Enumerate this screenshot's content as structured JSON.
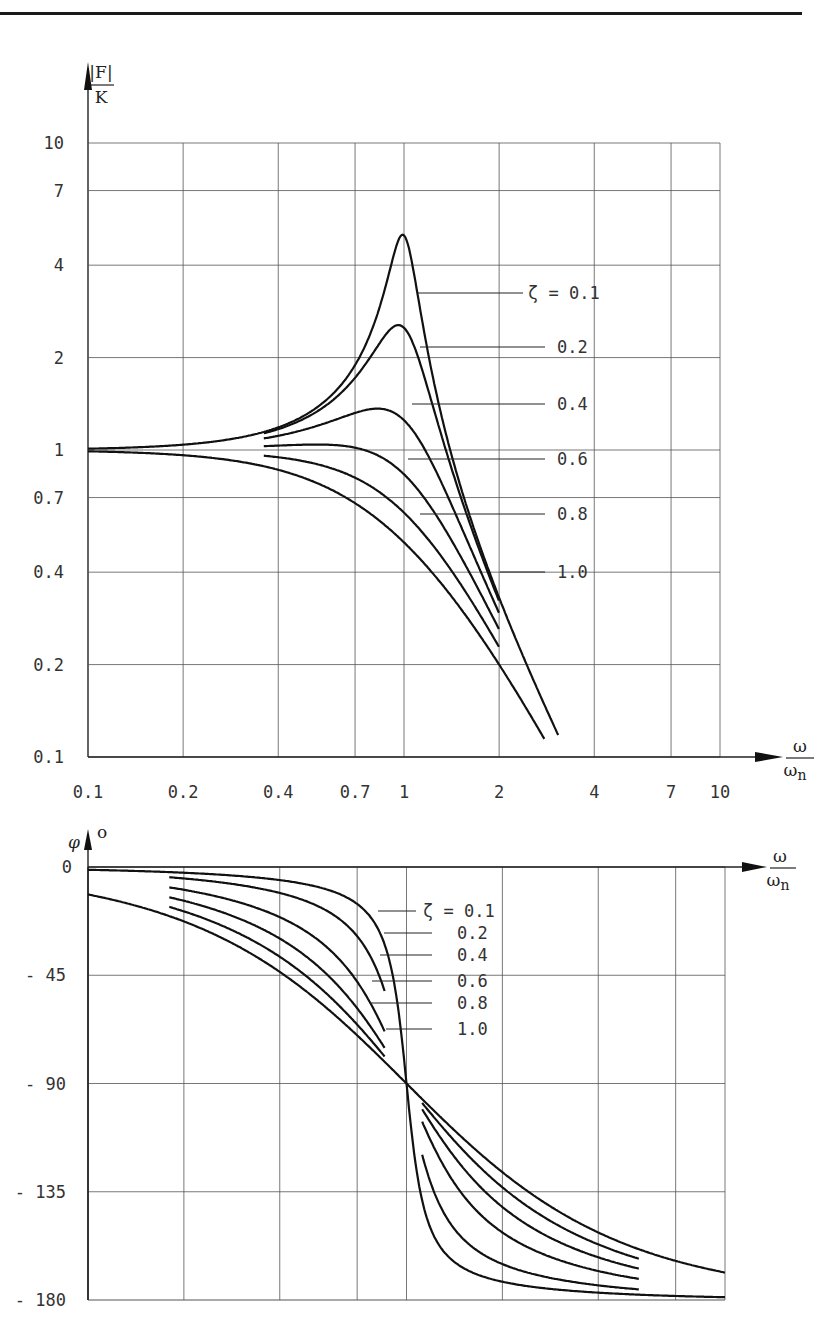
{
  "chart_data": [
    {
      "type": "line",
      "title": "Amplitude response of a second-order system",
      "ylabel": "|F|/K",
      "xlabel": "ω/ω_n",
      "xscale": "log",
      "yscale": "log",
      "xlim": [
        0.1,
        10
      ],
      "ylim": [
        0.1,
        10
      ],
      "grid": true,
      "x_ticks": [
        "0.1",
        "0.2",
        "0.4",
        "0.7",
        "1",
        "2",
        "4",
        "7",
        "10"
      ],
      "y_ticks": [
        "10",
        "7",
        "4",
        "2",
        "1",
        "0.7",
        "0.4",
        "0.2",
        "0.1"
      ],
      "legend": [
        "ζ = 0.1",
        "0.2",
        "0.4",
        "0.6",
        "0.8",
        "1.0"
      ],
      "x": [
        0.1,
        0.2,
        0.4,
        0.7,
        1.0,
        2.0,
        3.0
      ],
      "series": [
        {
          "name": "ζ = 0.1",
          "values": [
            1.01,
            1.04,
            1.19,
            1.94,
            5.0,
            0.33,
            0.12
          ]
        },
        {
          "name": "ζ = 0.2",
          "values": [
            1.01,
            1.04,
            1.18,
            1.81,
            2.5,
            0.33,
            0.12
          ]
        },
        {
          "name": "ζ = 0.4",
          "values": [
            1.01,
            1.03,
            1.14,
            1.39,
            1.25,
            0.31,
            0.12
          ]
        },
        {
          "name": "ζ = 0.6",
          "values": [
            1.0,
            1.01,
            1.05,
            1.0,
            0.83,
            0.28,
            0.11
          ]
        },
        {
          "name": "ζ = 0.8",
          "values": [
            0.99,
            0.98,
            0.96,
            0.8,
            0.63,
            0.25,
            0.11
          ]
        },
        {
          "name": "ζ = 1.0",
          "values": [
            0.99,
            0.96,
            0.86,
            0.67,
            0.5,
            0.2,
            0.1
          ]
        }
      ]
    },
    {
      "type": "line",
      "title": "Phase response of a second-order system",
      "ylabel": "φ °",
      "xlabel": "ω/ω_n",
      "xscale": "log",
      "xlim": [
        0.1,
        10
      ],
      "ylim": [
        -180,
        0
      ],
      "grid": true,
      "y_ticks": [
        "0",
        "- 45",
        "- 90",
        "- 135",
        "- 180"
      ],
      "legend": [
        "ζ = 0.1",
        "0.2",
        "0.4",
        "0.6",
        "0.8",
        "1.0"
      ],
      "x": [
        0.1,
        0.2,
        0.4,
        0.7,
        1.0,
        2.0,
        4.0,
        10.0
      ],
      "series": [
        {
          "name": "ζ = 0.1",
          "values": [
            -1,
            -2,
            -5,
            -15,
            -90,
            -172,
            -177,
            -179
          ]
        },
        {
          "name": "ζ = 0.2",
          "values": [
            -2,
            -5,
            -11,
            -29,
            -90,
            -165,
            -174,
            -178
          ]
        },
        {
          "name": "ζ = 0.4",
          "values": [
            -5,
            -10,
            -21,
            -48,
            -90,
            -152,
            -168,
            -175
          ]
        },
        {
          "name": "ζ = 0.6",
          "values": [
            -7,
            -14,
            -30,
            -59,
            -90,
            -141,
            -161,
            -173
          ]
        },
        {
          "name": "ζ = 0.8",
          "values": [
            -9,
            -18,
            -37,
            -67,
            -90,
            -133,
            -157,
            -171
          ]
        },
        {
          "name": "ζ = 1.0",
          "values": [
            -11,
            -23,
            -44,
            -70,
            -90,
            -127,
            -152,
            -169
          ]
        }
      ]
    }
  ],
  "amp": {
    "ylabel_top": "|F|",
    "ylabel_bottom": "K",
    "xlabel_top": "ω",
    "xlabel_bottom": "ω",
    "xlabel_sub": "n",
    "legend_first": "ζ = 0.1"
  },
  "phase": {
    "ylabel": "φ",
    "ylabel_unit": "o",
    "xlabel_top": "ω",
    "xlabel_bottom": "ω",
    "xlabel_sub": "n"
  }
}
